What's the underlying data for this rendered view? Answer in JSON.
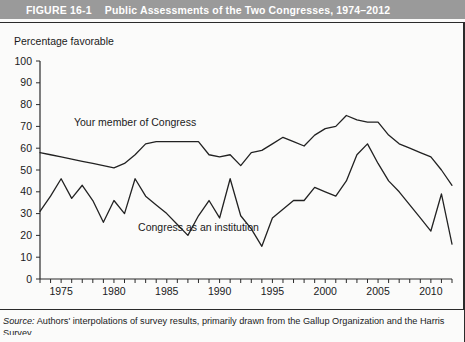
{
  "header": {
    "figure_number": "FIGURE 16-1",
    "title": "Public Assessments of the Two Congresses, 1974–2012",
    "bar_color": "#9a9a9a",
    "text_color": "#ffffff"
  },
  "source": {
    "label": "Source:",
    "text": " Authors' interpolations of survey results, primarily drawn from the Gallup Organization and the Harris",
    "continuation": "Survey."
  },
  "chart_data": {
    "type": "line",
    "title": "Public Assessments of the Two Congresses, 1974–2012",
    "xlabel": "",
    "ylabel": "Percentage favorable",
    "ylim": [
      0,
      100
    ],
    "xlim": [
      1973,
      2012
    ],
    "grid": false,
    "legend_position": "inline-annotation",
    "ytick_labels": [
      "0",
      "10",
      "20",
      "30",
      "40",
      "50",
      "60",
      "70",
      "80",
      "90",
      "100"
    ],
    "ytick_values": [
      0,
      10,
      20,
      30,
      40,
      50,
      60,
      70,
      80,
      90,
      100
    ],
    "xtick_labels": [
      "1975",
      "1980",
      "1985",
      "1990",
      "1995",
      "2000",
      "2005",
      "2010"
    ],
    "xtick_values": [
      1975,
      1980,
      1985,
      1990,
      1995,
      2000,
      2005,
      2010
    ],
    "x": [
      1973,
      1974,
      1975,
      1976,
      1977,
      1978,
      1979,
      1980,
      1981,
      1982,
      1983,
      1984,
      1985,
      1986,
      1987,
      1988,
      1989,
      1990,
      1991,
      1992,
      1993,
      1994,
      1995,
      1996,
      1997,
      1998,
      1999,
      2000,
      2001,
      2002,
      2003,
      2004,
      2005,
      2006,
      2007,
      2008,
      2009,
      2010,
      2011,
      2012
    ],
    "series": [
      {
        "name": "Your member of Congress",
        "color": "#222222",
        "label_x": 1982,
        "label_y": 70,
        "values": [
          58,
          57,
          56,
          55,
          54,
          53,
          52,
          51,
          53,
          57,
          62,
          63,
          63,
          63,
          63,
          63,
          57,
          56,
          57,
          52,
          58,
          59,
          62,
          65,
          63,
          61,
          66,
          69,
          70,
          75,
          73,
          72,
          72,
          66,
          62,
          60,
          58,
          56,
          50,
          43
        ]
      },
      {
        "name": "Congress as an institution",
        "color": "#222222",
        "label_x": 1988,
        "label_y": 22,
        "values": [
          31,
          38,
          46,
          37,
          43,
          36,
          26,
          36,
          30,
          46,
          38,
          34,
          30,
          25,
          20,
          29,
          36,
          28,
          46,
          29,
          23,
          15,
          28,
          32,
          36,
          36,
          42,
          40,
          38,
          45,
          57,
          62,
          53,
          45,
          40,
          34,
          28,
          22,
          39,
          16
        ]
      }
    ],
    "annotations": [
      {
        "text": "Your member of Congress",
        "x": 1982,
        "y": 70
      },
      {
        "text": "Congress as an institution",
        "x": 1988,
        "y": 22
      }
    ]
  }
}
